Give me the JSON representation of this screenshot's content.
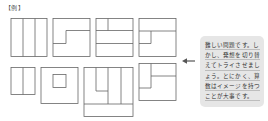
{
  "label": "【例】",
  "callout": {
    "text": "難しい問題です。しかし、発想を切り替えてトライさせましょう。とにかく、算数はイメージを持つことが大事です。",
    "background": "#e6e6e6"
  },
  "arrow": {
    "direction": "left",
    "color": "#555555"
  },
  "figures": {
    "stroke": "#666666",
    "count": 8,
    "row1": [
      "three-vertical-strips",
      "stepped-split",
      "top-split-with-two-horizontal-bands",
      "top-band-with-left-notch"
    ],
    "row2": [
      "two-vertical-strips",
      "square-with-inner-square",
      "three-columns-with-notch-and-bottom-bar",
      "left-column-with-right-step"
    ]
  }
}
